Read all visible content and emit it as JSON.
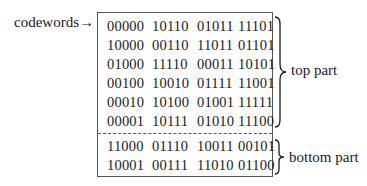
{
  "codewords_label": "codewords→",
  "top_part": {
    "label": "top part",
    "rows": [
      [
        "00000",
        "10110",
        "01011",
        "11101"
      ],
      [
        "10000",
        "00110",
        "11011",
        "01101"
      ],
      [
        "01000",
        "11110",
        "00011",
        "10101"
      ],
      [
        "00100",
        "10010",
        "01111",
        "11001"
      ],
      [
        "00010",
        "10100",
        "01001",
        "11111"
      ],
      [
        "00001",
        "10111",
        "01010",
        "11100"
      ]
    ]
  },
  "bottom_part": {
    "label": "bottom part",
    "rows": [
      [
        "11000",
        "01110",
        "10011",
        "00101"
      ],
      [
        "10001",
        "00111",
        "11010",
        "01100"
      ]
    ]
  }
}
